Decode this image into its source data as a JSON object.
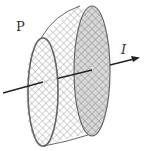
{
  "diagram": {
    "labels": {
      "face": "P",
      "current": "I"
    },
    "colors": {
      "stroke": "#555555",
      "hatch": "#9a9a9a",
      "back_face_fill": "#d6d6d6",
      "arrow": "#222222"
    }
  }
}
